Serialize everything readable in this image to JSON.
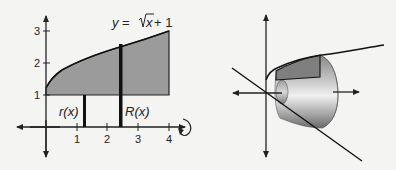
{
  "left_figure": {
    "equation": {
      "prefix": "y = ",
      "radicand": "x",
      "suffix": " + 1"
    },
    "y_ticks": [
      "1",
      "2",
      "3"
    ],
    "x_ticks": [
      "1",
      "2",
      "3",
      "4"
    ],
    "labels": {
      "inner_radius": "r(x)",
      "outer_radius": "R(x)"
    },
    "region_fill": "#9a9a9a",
    "rotation_indicator": "rotate-about-x-axis"
  },
  "right_figure": {
    "description": "solid of revolution (washer) about x-axis",
    "solid_colors": {
      "light": "#e6e6e6",
      "mid": "#b0b0b0",
      "dark": "#6e6e6e"
    }
  }
}
